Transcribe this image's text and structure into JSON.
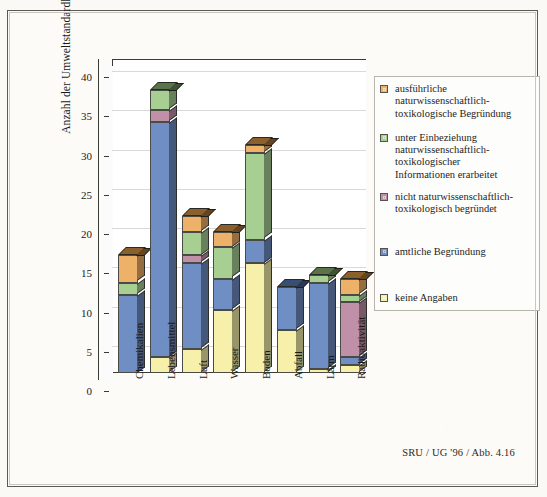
{
  "caption": "SRU / UG '96 / Abb. 4.16",
  "chart_data": {
    "type": "bar",
    "subtype": "stacked-column-3d",
    "title": "",
    "xlabel": "",
    "ylabel": "Anzahl der Umweltstandardlisten",
    "ylim": [
      0,
      40
    ],
    "yticks": [
      0,
      5,
      10,
      15,
      20,
      25,
      30,
      35,
      40
    ],
    "ytick_labels": [
      "0",
      "5",
      "10",
      "15",
      "20",
      "25",
      "30",
      "35",
      "40"
    ],
    "grid": true,
    "legend_position": "right",
    "categories": [
      "Chemikalien",
      "Lebensmittel",
      "Luft",
      "Wasser",
      "Boden",
      "Abfall",
      "Lärm",
      "Radioaktivität"
    ],
    "series": [
      {
        "name": "keine Angaben",
        "color": "#f7f0ab",
        "values": [
          0,
          2,
          3,
          8,
          14,
          5.5,
          0.5,
          1
        ]
      },
      {
        "name": "amtliche Begründung",
        "color": "#6f8ec4",
        "values": [
          10,
          30,
          11,
          4,
          3,
          5.5,
          11,
          1
        ]
      },
      {
        "name": "nicht naturwissenschaftlich-toxikologisch begründet",
        "color": "#c08fa8",
        "values": [
          0,
          1.5,
          1,
          0,
          0,
          0,
          0,
          7
        ]
      },
      {
        "name": "unter Einbeziehung naturwissenschaftlich-toxikologischer Informationen erarbeitet",
        "color": "#a8cf92",
        "values": [
          1.5,
          2.5,
          3,
          4,
          11,
          0,
          1,
          1
        ]
      },
      {
        "name": "ausführliche naturwissenschaftlich-toxikologische Begründung",
        "color": "#eeb169",
        "values": [
          3.5,
          0,
          2,
          2,
          1,
          0,
          0,
          2
        ]
      }
    ],
    "totals": [
      15,
      36,
      20,
      18,
      29,
      11,
      12.5,
      12
    ]
  },
  "legend": {
    "items": [
      {
        "color": "#eeb169",
        "lines": [
          "ausführliche",
          "naturwissenschaftlich-",
          "toxikologische Begründung"
        ]
      },
      {
        "color": "#a8cf92",
        "lines": [
          "unter Einbeziehung",
          "naturwissenschaftlich-",
          "toxikologischer",
          "Informationen erarbeitet"
        ]
      },
      {
        "color": "#c08fa8",
        "lines": [
          "nicht naturwissenschaftlich-",
          "toxikologisch begründet"
        ]
      },
      {
        "color": "#6f8ec4",
        "lines": [
          "amtliche Begründung"
        ]
      },
      {
        "color": "#f7f0ab",
        "lines": [
          "keine Angaben"
        ]
      }
    ]
  }
}
